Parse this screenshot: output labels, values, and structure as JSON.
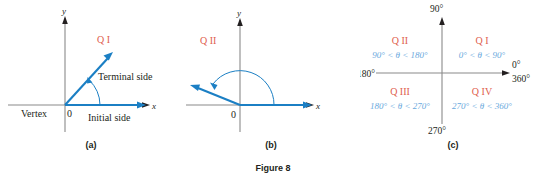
{
  "figure": {
    "caption": "Figure 8",
    "panels": [
      {
        "key": "a",
        "caption": "(a)",
        "quadrant_label": "Q I",
        "axis_x": "x",
        "axis_y": "y",
        "origin": "0",
        "vertex_label": "Vertex",
        "initial_side_label": "Initial side",
        "terminal_side_label": "Terminal side"
      },
      {
        "key": "b",
        "caption": "(b)",
        "quadrant_label": "Q II",
        "axis_x": "x",
        "axis_y": "y",
        "origin": "0"
      },
      {
        "key": "c",
        "caption": "(c)",
        "axis_labels": {
          "top": "90°",
          "left": "180°",
          "bottom": "270°",
          "right_top": "0°",
          "right_bottom": "360°"
        },
        "quadrants": [
          {
            "name": "Q I",
            "range": "0° < θ < 90°"
          },
          {
            "name": "Q II",
            "range": "90° < θ < 180°"
          },
          {
            "name": "Q III",
            "range": "180° < θ < 270°"
          },
          {
            "name": "Q IV",
            "range": "270° < θ < 360°"
          }
        ]
      }
    ]
  },
  "colors": {
    "ray_blue": "#1b7fc4",
    "quadrant_red": "#e0604d",
    "range_blue": "#6aa9dd",
    "axis_gray": "#8a8a8a",
    "text_black": "#231f20"
  }
}
